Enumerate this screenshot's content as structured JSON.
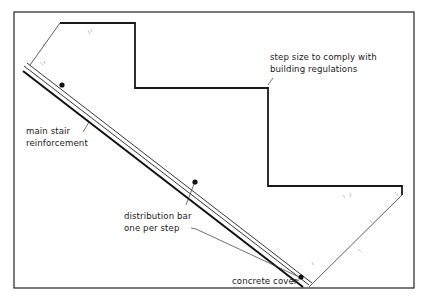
{
  "caption_partial": "Stair section – reinforcement",
  "diagram": {
    "labels": {
      "step_size_line1": "step size to comply with",
      "step_size_line2": "building regulations",
      "main_reinf_line1": "main stair",
      "main_reinf_line2": "reinforcement",
      "distribution_line1": "distribution bar",
      "distribution_line2": "one per step",
      "concrete_cover": "concrete cover"
    },
    "elements": {
      "steps_count": 3,
      "distribution_bars_count": 3
    },
    "colors": {
      "line": "#1a1a1a",
      "background": "#ffffff",
      "frame": "#222222"
    }
  }
}
